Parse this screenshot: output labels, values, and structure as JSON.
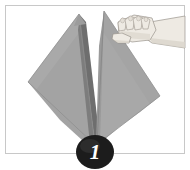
{
  "figure": {
    "name": "napkin-fold-step-illustration",
    "alt_description": "Hand holding up a folded gray cloth napkin",
    "step_number": "1",
    "background_color": "#ffffff",
    "frame": {
      "border_color": "#c8c8c8",
      "border_width": 1,
      "inset": 5
    }
  },
  "badge": {
    "label": "1",
    "fill_color": "#1c1c1c",
    "text_color": "#ffffff",
    "highlight_color": "#4a4a4a",
    "center_x": 95,
    "center_y": 152,
    "radius_x": 19,
    "radius_y": 17
  },
  "cloth": {
    "name": "gray-cloth-napkin",
    "left_panel_color": "#a3a3a3",
    "right_panel_color": "#a8a8a8",
    "fold_shadow_color": "#777777",
    "fold_dark_color": "#6e6e6e",
    "crease_color": "#8e8e8e",
    "edge_line_color": "#8a8a8a",
    "highlight_color": "#b4b4b4"
  },
  "hand": {
    "name": "human-hand-grasping-cloth",
    "skin_color": "#eeeae3",
    "skin_shadow_color": "#d9d4cb",
    "outline_color": "#9a948c",
    "nail_color": "#e4dfd7",
    "finger_count": 4
  }
}
